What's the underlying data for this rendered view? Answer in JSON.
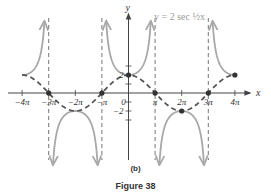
{
  "chart_data": {
    "type": "line",
    "title": "",
    "equation_label": "y = 2 sec ½x",
    "xlabel": "x",
    "ylabel": "y",
    "xlim": [
      -4.3,
      4.6
    ],
    "ylim": [
      -5.3,
      8.5
    ],
    "x_unit": "pi",
    "x_ticks": [
      -4,
      -3,
      -2,
      -1,
      0,
      1,
      2,
      3,
      4
    ],
    "x_tick_labels": [
      "−4π",
      "−3π",
      "−2π",
      "−π",
      "0",
      "π",
      "2π",
      "3π",
      "4π"
    ],
    "y_ticks": [
      -2,
      2
    ],
    "y_tick_labels": [
      "−2",
      "2"
    ],
    "asymptotes_x_pi": [
      -3,
      -1,
      1,
      3
    ],
    "series": [
      {
        "name": "y = 2 sec (1/2)x",
        "style": "solid",
        "color": "#a8a8a8",
        "description": "secant branches between asymptotes"
      },
      {
        "name": "y = 2 cos (1/2)x",
        "style": "dashed",
        "color": "#555555",
        "x_pi": [
          -4,
          -3,
          -2,
          -1,
          0,
          1,
          2,
          3,
          4
        ],
        "values": [
          2,
          0,
          -2,
          0,
          2,
          0,
          -2,
          0,
          2
        ]
      }
    ],
    "marked_points_pi": [
      {
        "x": -3,
        "y": 0
      },
      {
        "x": -1,
        "y": 0
      },
      {
        "x": 0,
        "y": 2
      },
      {
        "x": 1,
        "y": 0
      },
      {
        "x": 2,
        "y": -2
      },
      {
        "x": 3,
        "y": 0
      },
      {
        "x": 4,
        "y": 2
      }
    ],
    "grid": false,
    "legend": "none"
  },
  "captions": {
    "subfigure": "(b)",
    "figure": "Figure 38"
  },
  "colors": {
    "secant": "#a8a8a8",
    "cosine": "#555555",
    "axis": "#444444",
    "asymptote": "#666666"
  }
}
